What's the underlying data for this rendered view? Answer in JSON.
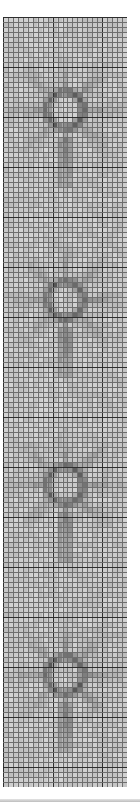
{
  "figure": {
    "kind": "cross-stitch style pattern grid",
    "columns": 25,
    "rows": 154,
    "cell_px": 5,
    "colors": {
      "background": "#ffffff",
      "light_cell": "#e9e9e9",
      "dark_cell": "#3a3a3a",
      "grid_line": "#6e6e6e",
      "major_grid_line": "#2e2e2e"
    },
    "motifs": [
      {
        "name": "flower-1",
        "col": 12,
        "row": 18
      },
      {
        "name": "flower-2",
        "col": 12,
        "row": 56
      },
      {
        "name": "flower-3",
        "col": 12,
        "row": 93
      },
      {
        "name": "flower-4",
        "col": 12,
        "row": 131
      }
    ]
  }
}
